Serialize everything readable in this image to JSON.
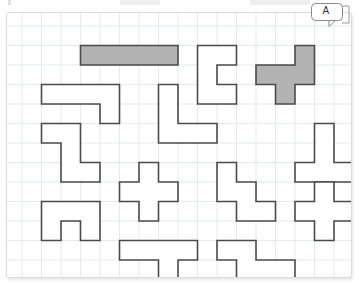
{
  "page": {
    "width": 359,
    "height": 295
  },
  "callout": {
    "label": "A",
    "name": "callout-badge-a"
  },
  "board": {
    "cell_size": 19.5,
    "origin_x": 15,
    "origin_y": 13,
    "cols": 17,
    "rows": 13,
    "grid_color": "#dfe3ea",
    "grid_line_width": 0.8,
    "panel_background": "#ffffff",
    "panel_border_color": "#dcdcdc"
  },
  "style": {
    "shape_stroke": "#4a4a4a",
    "shape_stroke_width": 1.6,
    "shape_fill_empty": "#ffffff",
    "shape_fill_highlight": "#b3b3b3",
    "highlight_stroke": "#4a4a4a"
  },
  "shapes": [
    {
      "id": "shape-1",
      "name": "i-pentomino-horizontal-bar",
      "filled": true,
      "fill": "#b3b3b3",
      "cells": [
        [
          3,
          1
        ],
        [
          4,
          1
        ],
        [
          5,
          1
        ],
        [
          6,
          1
        ],
        [
          7,
          1
        ]
      ]
    },
    {
      "id": "shape-2",
      "name": "p-pentomino-top-center",
      "filled": false,
      "fill": "#ffffff",
      "cells": [
        [
          9,
          1
        ],
        [
          10,
          1
        ],
        [
          9,
          2
        ],
        [
          9,
          3
        ],
        [
          10,
          3
        ]
      ]
    },
    {
      "id": "shape-3",
      "name": "f-pentomino-highlighted-top-right",
      "filled": true,
      "fill": "#b3b3b3",
      "cells": [
        [
          14,
          1
        ],
        [
          12,
          2
        ],
        [
          13,
          2
        ],
        [
          14,
          2
        ],
        [
          13,
          3
        ]
      ]
    },
    {
      "id": "shape-4",
      "name": "n-pentomino-left-row2",
      "filled": false,
      "fill": "#ffffff",
      "cells": [
        [
          1,
          3
        ],
        [
          2,
          3
        ],
        [
          3,
          3
        ],
        [
          4,
          3
        ],
        [
          4,
          4
        ]
      ]
    },
    {
      "id": "shape-5",
      "name": "l-pentomino-center-left",
      "filled": false,
      "fill": "#ffffff",
      "cells": [
        [
          7,
          3
        ],
        [
          7,
          4
        ],
        [
          7,
          5
        ],
        [
          8,
          5
        ],
        [
          9,
          5
        ]
      ]
    },
    {
      "id": "shape-6",
      "name": "w-pentomino-left-middle",
      "filled": false,
      "fill": "#ffffff",
      "cells": [
        [
          1,
          5
        ],
        [
          2,
          5
        ],
        [
          2,
          6
        ],
        [
          2,
          7
        ],
        [
          3,
          7
        ]
      ]
    },
    {
      "id": "shape-7",
      "name": "t-pentomino-right-middle",
      "filled": false,
      "fill": "#ffffff",
      "cells": [
        [
          15,
          5
        ],
        [
          15,
          6
        ],
        [
          14,
          7
        ],
        [
          15,
          7
        ],
        [
          16,
          7
        ]
      ]
    },
    {
      "id": "shape-8",
      "name": "x-pentomino-plus-center",
      "filled": false,
      "fill": "#ffffff",
      "cells": [
        [
          6,
          7
        ],
        [
          5,
          8
        ],
        [
          6,
          8
        ],
        [
          7,
          8
        ],
        [
          6,
          9
        ]
      ]
    },
    {
      "id": "shape-9",
      "name": "n-pentomino-step-center-right",
      "filled": false,
      "fill": "#ffffff",
      "cells": [
        [
          10,
          7
        ],
        [
          10,
          8
        ],
        [
          11,
          8
        ],
        [
          11,
          9
        ],
        [
          12,
          9
        ]
      ]
    },
    {
      "id": "shape-10",
      "name": "f-pentomino-right-lower",
      "filled": false,
      "fill": "#ffffff",
      "cells": [
        [
          15,
          8
        ],
        [
          14,
          9
        ],
        [
          15,
          9
        ],
        [
          16,
          9
        ],
        [
          15,
          10
        ]
      ]
    },
    {
      "id": "shape-11",
      "name": "u-pentomino-bottom-left",
      "filled": false,
      "fill": "#ffffff",
      "cells": [
        [
          1,
          9
        ],
        [
          2,
          9
        ],
        [
          3,
          9
        ],
        [
          1,
          10
        ],
        [
          3,
          10
        ]
      ]
    },
    {
      "id": "shape-12",
      "name": "t-pentomino-bottom-center",
      "filled": false,
      "fill": "#ffffff",
      "cells": [
        [
          5,
          11
        ],
        [
          6,
          11
        ],
        [
          7,
          11
        ],
        [
          8,
          11
        ],
        [
          7,
          12
        ]
      ]
    },
    {
      "id": "shape-13",
      "name": "n-pentomino-bottom-right",
      "filled": false,
      "fill": "#ffffff",
      "cells": [
        [
          10,
          11
        ],
        [
          11,
          11
        ],
        [
          11,
          12
        ],
        [
          12,
          12
        ],
        [
          13,
          12
        ]
      ]
    }
  ]
}
